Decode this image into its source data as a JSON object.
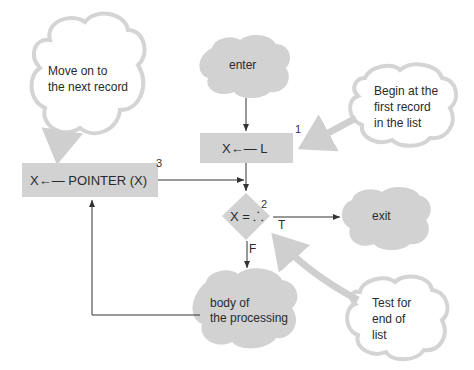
{
  "nodes": {
    "enter": {
      "label": "enter"
    },
    "init": {
      "label": "X←— L",
      "number": "1"
    },
    "test": {
      "label": "X = ⸫",
      "number": "2"
    },
    "advance": {
      "label": "X←— POINTER (X)",
      "number": "3"
    },
    "exit": {
      "label": "exit"
    },
    "body": {
      "line1": "body of",
      "line2": "the processing"
    }
  },
  "edges": {
    "true_label": "T",
    "false_label": "F"
  },
  "notes": {
    "move": {
      "line1": "Move on to",
      "line2": "the next record"
    },
    "begin": {
      "line1": "Begin at the",
      "line2": "first record",
      "line3": "in the list"
    },
    "test": {
      "line1": "Test for",
      "line2": "end of",
      "line3": "list"
    }
  },
  "colors": {
    "fill": "#d2d2d2",
    "cloud_outline": "#d6d6d6",
    "line": "#333333"
  }
}
